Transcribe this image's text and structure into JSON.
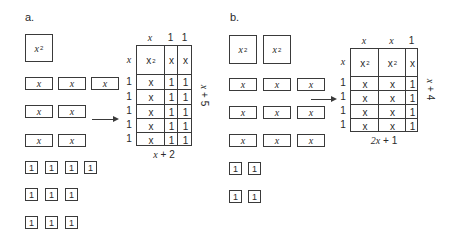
{
  "panels": {
    "a": {
      "label": "a.",
      "tiles": {
        "x2": {
          "var": "x",
          "exp": "2",
          "count": 1
        },
        "x": {
          "var": "x",
          "count": 7
        },
        "one": {
          "text": "1",
          "count": 10
        }
      },
      "grid": {
        "top_labels": [
          "x",
          "1",
          "1"
        ],
        "left_labels": [
          "x",
          "1",
          "1",
          "1",
          "1",
          "1"
        ],
        "first_row": [
          {
            "var": "x",
            "exp": "2"
          },
          {
            "var": "x"
          },
          {
            "var": "x"
          }
        ],
        "body_cells": [
          "x",
          "1",
          "1"
        ],
        "width_label": "x + 2",
        "height_label": "x + 5"
      }
    },
    "b": {
      "label": "b.",
      "tiles": {
        "x2": {
          "var": "x",
          "exp": "2",
          "count": 2
        },
        "x": {
          "var": "x",
          "count": 9
        },
        "one": {
          "text": "1",
          "count": 4
        }
      },
      "grid": {
        "top_labels": [
          "x",
          "x",
          "1"
        ],
        "left_labels": [
          "x",
          "1",
          "1",
          "1",
          "1"
        ],
        "first_row": [
          {
            "var": "x",
            "exp": "2"
          },
          {
            "var": "x",
            "exp": "2"
          },
          {
            "var": "x"
          }
        ],
        "body_cells": [
          "x",
          "x",
          "1"
        ],
        "width_label": "2x + 1",
        "height_label": "x + 4"
      }
    }
  }
}
